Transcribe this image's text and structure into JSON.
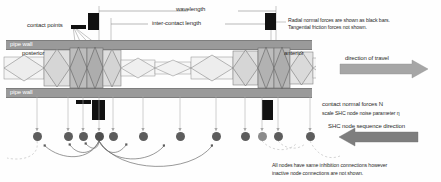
{
  "diagram": {
    "labels": {
      "wavelength": "wavelength",
      "inter_contact_length": "inter-contact length",
      "contact_points": "contact points",
      "pipe_wall_top": "pipe wall",
      "pipe_wall_bottom": "pipe wall",
      "posterior": "posterior",
      "anterior": "anterior",
      "direction_of_travel": "direction of travel",
      "shc_sequence_direction": "SHC node sequence direction"
    },
    "notes": {
      "radial_forces_line1": "Radial normal forces are shown as black bars.",
      "radial_forces_line2": "Tangential friction forces not shown.",
      "contact_forces_line1": "contact normal forces N",
      "contact_forces_line2": "scale SHC node noise parameter η",
      "inhibition_line1": "All nodes have same inhibition connections however",
      "inhibition_line2": "inactive node connections are not shown."
    },
    "colors": {
      "pipe_wall": "#9a9a9a",
      "force_bar": "#111111",
      "node": "#5d5d5d",
      "node_dim": "#8b8b8b",
      "arrow": "#9d9d9d",
      "segment_light": "#efefef",
      "segment_mid": "#d8d8d8",
      "segment_dark": "#b4b4b4",
      "measure_line": "#8c8c8c",
      "text": "#2b2b2b"
    },
    "geometry": {
      "pipe_top_y": 40,
      "pipe_bottom_y": 88,
      "body_axis_y": 68,
      "node_row_y": 136
    },
    "force_bars_top": [
      {
        "x": 71,
        "y": 25,
        "w": 15,
        "h": 4
      },
      {
        "x": 88,
        "y": 13,
        "w": 11,
        "h": 17
      },
      {
        "x": 265,
        "y": 13,
        "w": 11,
        "h": 17
      }
    ],
    "force_bars_bottom": [
      {
        "x": 76,
        "y": 100,
        "w": 15,
        "h": 4
      },
      {
        "x": 92,
        "y": 100,
        "w": 13,
        "h": 20
      },
      {
        "x": 262,
        "y": 100,
        "w": 11,
        "h": 20
      }
    ],
    "nodes": [
      {
        "x": 37,
        "state": "normal"
      },
      {
        "x": 68,
        "state": "normal"
      },
      {
        "x": 83,
        "state": "normal"
      },
      {
        "x": 99,
        "state": "active"
      },
      {
        "x": 113,
        "state": "normal"
      },
      {
        "x": 143,
        "state": "normal"
      },
      {
        "x": 180,
        "state": "normal"
      },
      {
        "x": 216,
        "state": "normal"
      },
      {
        "x": 245,
        "state": "normal"
      },
      {
        "x": 262,
        "state": "dim"
      },
      {
        "x": 278,
        "state": "normal"
      },
      {
        "x": 310,
        "state": "normal"
      }
    ],
    "body_segments": [
      {
        "x": 6,
        "w": 38,
        "type": "expanded",
        "shade": "light"
      },
      {
        "x": 48,
        "w": 23,
        "type": "compressed",
        "shade": "mid"
      },
      {
        "x": 71,
        "w": 16,
        "type": "contact",
        "shade": "dark"
      },
      {
        "x": 87,
        "w": 15,
        "type": "contact",
        "shade": "dark"
      },
      {
        "x": 102,
        "w": 17,
        "type": "compressed",
        "shade": "mid"
      },
      {
        "x": 122,
        "w": 34,
        "type": "expanded",
        "shade": "light"
      },
      {
        "x": 158,
        "w": 34,
        "type": "expanded",
        "shade": "light"
      },
      {
        "x": 196,
        "w": 34,
        "type": "expanded",
        "shade": "light"
      },
      {
        "x": 234,
        "w": 24,
        "type": "compressed",
        "shade": "mid"
      },
      {
        "x": 258,
        "w": 16,
        "type": "contact",
        "shade": "dark"
      },
      {
        "x": 274,
        "w": 16,
        "type": "contact",
        "shade": "dark"
      },
      {
        "x": 290,
        "w": 22,
        "type": "compressed",
        "shade": "mid"
      },
      {
        "x": 314,
        "w": 38,
        "type": "expanded",
        "shade": "light"
      }
    ],
    "measures": {
      "wavelength_x1": 99,
      "wavelength_x2": 276,
      "wavelength_y": 11,
      "inter_contact_x1": 111,
      "inter_contact_x2": 271,
      "inter_contact_y": 24
    },
    "arrows": {
      "travel": {
        "x": 352,
        "y": 66,
        "w": 66,
        "dir": "right"
      },
      "sequence": {
        "x": 345,
        "y": 134,
        "w": 66,
        "dir": "left"
      }
    }
  }
}
